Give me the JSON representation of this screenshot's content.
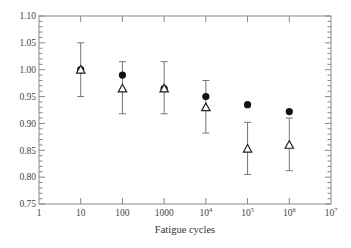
{
  "chart_data": {
    "type": "scatter",
    "title": "",
    "xlabel": "Fatigue cycles",
    "ylabel": "",
    "xscale": "log",
    "xlim": [
      1,
      10000000
    ],
    "ylim": [
      0.75,
      1.1
    ],
    "grid": false,
    "legend": null,
    "x_ticks": [
      {
        "value": 1,
        "label": "1"
      },
      {
        "value": 10,
        "label": "10"
      },
      {
        "value": 100,
        "label": "100"
      },
      {
        "value": 1000,
        "label": "1000"
      },
      {
        "value": 10000,
        "label": "10",
        "sup": "4"
      },
      {
        "value": 100000,
        "label": "10",
        "sup": "5"
      },
      {
        "value": 1000000,
        "label": "10",
        "sup": "6"
      },
      {
        "value": 10000000,
        "label": "10",
        "sup": "7"
      }
    ],
    "y_ticks": [
      "0.75",
      "0.80",
      "0.85",
      "0.90",
      "0.95",
      "1.00",
      "1.05",
      "1.10"
    ],
    "y_minor_step": 0.01,
    "x": [
      10,
      100,
      1000,
      10000,
      100000,
      1000000
    ],
    "series": [
      {
        "name": "filled circles",
        "marker": "circle-filled",
        "values": [
          1.0,
          0.99,
          0.965,
          0.95,
          0.935,
          0.922
        ]
      },
      {
        "name": "open triangles",
        "marker": "triangle-open",
        "values": [
          1.0,
          0.965,
          0.965,
          0.93,
          0.853,
          0.86
        ],
        "error_low": [
          0.95,
          0.918,
          0.918,
          0.882,
          0.805,
          0.812
        ],
        "error_high": [
          1.05,
          1.015,
          1.015,
          0.98,
          0.902,
          0.91
        ]
      }
    ]
  }
}
